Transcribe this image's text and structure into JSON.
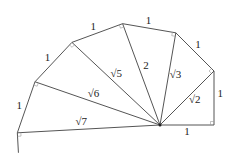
{
  "outer_labels": [
    "1",
    "1",
    "1",
    "1",
    "1",
    "1",
    "1"
  ],
  "hypotenuse_labels": [
    "√2",
    "√3",
    "2",
    "√5",
    "√6",
    "√7"
  ],
  "triangle_count": 6,
  "colors": {
    "line": "#555555",
    "text": "#222222"
  }
}
